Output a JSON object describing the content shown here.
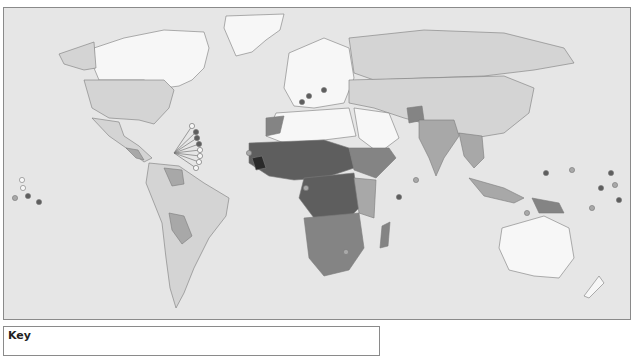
{
  "map": {
    "type": "choropleth-world-map",
    "style": "grayscale",
    "shades": {
      "ocean": "#e6e6e6",
      "level_0": "#f7f7f7",
      "level_1": "#d4d4d4",
      "level_2": "#a8a8a8",
      "level_3": "#848484",
      "level_4": "#5e5e5e",
      "level_5": "#2a2a2a"
    }
  },
  "key": {
    "title": "Key"
  }
}
